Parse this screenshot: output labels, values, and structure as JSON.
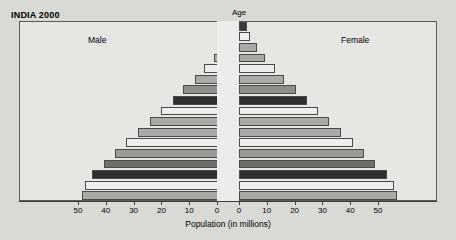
{
  "chart_data": {
    "type": "bar",
    "subtype": "population-pyramid",
    "title": "INDIA 2000",
    "xlabel": "Population (in millions)",
    "ylabel": "Age",
    "grid": false,
    "legend_position": "inline-labels",
    "xlim": [
      -60,
      60
    ],
    "axis_ticks_left": [
      "50",
      "40",
      "30",
      "20",
      "10",
      "0"
    ],
    "axis_ticks_right": [
      "0",
      "10",
      "20",
      "30",
      "40",
      "50"
    ],
    "tick_values": [
      50,
      40,
      30,
      20,
      10,
      0,
      0,
      10,
      20,
      30,
      40,
      50
    ],
    "categories": [
      "80+",
      "75-79",
      "70-74",
      "65-69",
      "60-64",
      "55-59",
      "50-54",
      "45-49",
      "40-44",
      "35-39",
      "30-34",
      "25-29",
      "20-24",
      "15-19",
      "10-14",
      "5-9",
      "0-4"
    ],
    "series": [
      {
        "name": "Male",
        "side": "left",
        "values": [
          2.4,
          3.6,
          6.4,
          9.0,
          12.5,
          15.9,
          20.0,
          23.9,
          28.0,
          32.1,
          36.4,
          40.7,
          44.6,
          48.6,
          52.9,
          55.4,
          56.4
        ]
      },
      {
        "name": "Female",
        "side": "right",
        "values": [
          2.7,
          3.9,
          6.6,
          9.3,
          12.9,
          16.2,
          20.4,
          24.3,
          28.4,
          32.5,
          36.8,
          41.1,
          45.0,
          49.0,
          53.2,
          55.7,
          56.8
        ]
      }
    ],
    "bar_colors": [
      "#3a3a3a",
      "#efeeec",
      "#a9a9a6",
      "#a9a9a6",
      "#eeedeb",
      "#a9a9a6",
      "#8e8e8b",
      "#2f2f2f",
      "#efeeec",
      "#a9a9a6",
      "#a9a9a6",
      "#efeeec",
      "#9a9a97",
      "#6d6d6a",
      "#2f2f2f",
      "#efeeec",
      "#a9a9a6"
    ]
  },
  "labels": {
    "title": "INDIA 2000",
    "age_header": "Age",
    "male": "Male",
    "female": "Female",
    "axis_title": "Population (in millions)"
  }
}
